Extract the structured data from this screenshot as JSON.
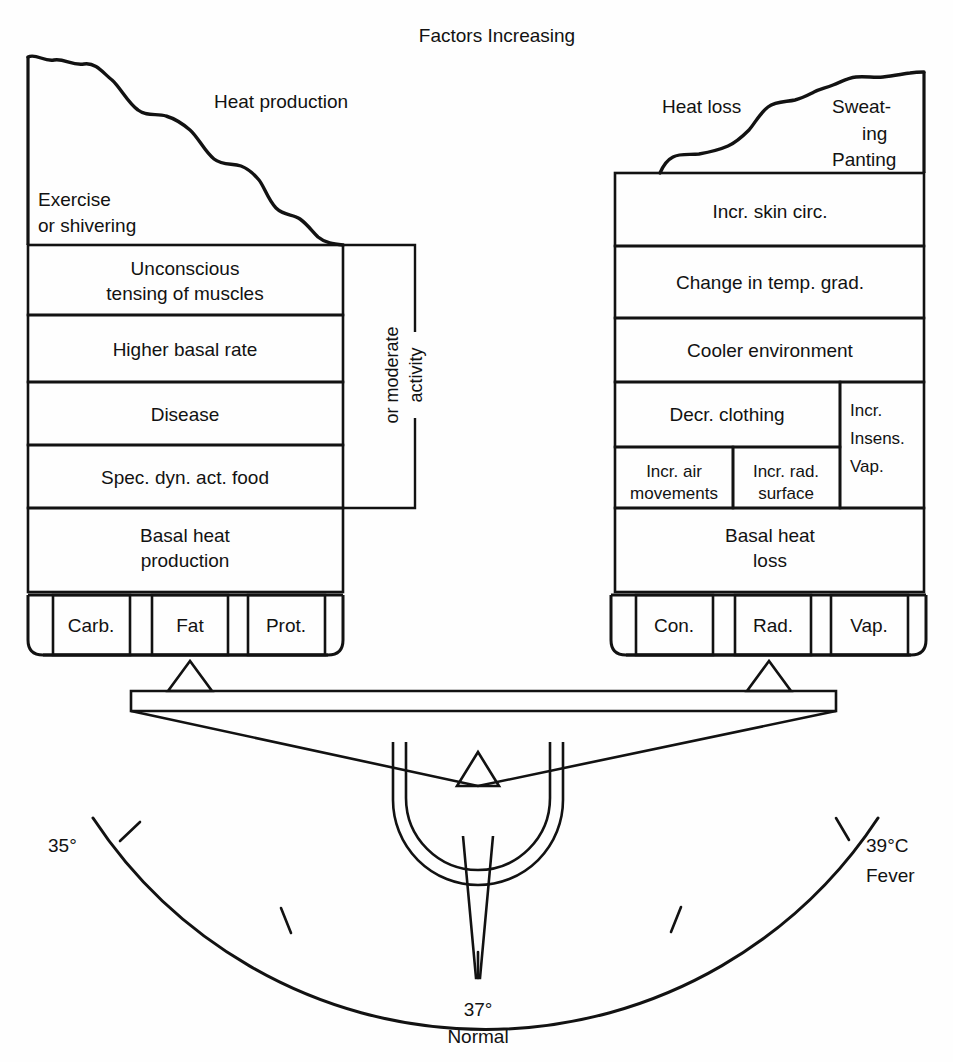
{
  "title": "Factors Increasing",
  "colors": {
    "ink": "#121212",
    "paper": "#fefefe"
  },
  "left_column": {
    "curve_label": "Heat production",
    "top_label_line1": "Exercise",
    "top_label_line2": "or shivering",
    "boxes": [
      {
        "line1": "Unconscious",
        "line2": "tensing of muscles"
      },
      {
        "line1": "Higher basal rate",
        "line2": ""
      },
      {
        "line1": "Disease",
        "line2": ""
      },
      {
        "line1": "Spec. dyn. act. food",
        "line2": ""
      },
      {
        "line1": "Basal heat",
        "line2": "production"
      }
    ],
    "bracket_label_line1": "or moderate",
    "bracket_label_line2": "activity",
    "pan_cells": [
      "Carb.",
      "Fat",
      "Prot."
    ]
  },
  "right_column": {
    "curve_label": "Heat loss",
    "top_label_line1": "Sweat-",
    "top_label_line2": "ing",
    "top_label_line3": "Panting",
    "boxes": [
      {
        "line1": "Incr. skin circ.",
        "line2": ""
      },
      {
        "line1": "Change in temp. grad.",
        "line2": ""
      },
      {
        "line1": "Cooler environment",
        "line2": ""
      },
      {
        "line1": "Decr. clothing",
        "line2": ""
      }
    ],
    "sub_left": {
      "line1": "Incr. air",
      "line2": "movements"
    },
    "sub_mid": {
      "line1": "Incr. rad.",
      "line2": "surface"
    },
    "side_box": {
      "line1": "Incr.",
      "line2": "Insens.",
      "line3": "Vap."
    },
    "basal": {
      "line1": "Basal heat",
      "line2": "loss"
    },
    "pan_cells": [
      "Con.",
      "Rad.",
      "Vap."
    ]
  },
  "scale": {
    "left_label": "35°",
    "center_label_line1": "37°",
    "center_label_line2": "Normal",
    "right_label_line1": "39°C",
    "right_label_line2": "Fever",
    "ticks": [
      35,
      36,
      37,
      38,
      39
    ],
    "needle_value": 37
  }
}
